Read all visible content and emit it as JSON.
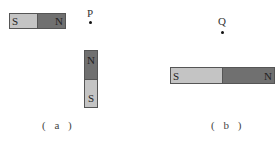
{
  "colors": {
    "south": "#c4c4c4",
    "north": "#707070",
    "outline": "#555555"
  },
  "panel_a": {
    "caption": "( a )",
    "point_label": "P",
    "magnet_horizontal": {
      "left_pole": "S",
      "right_pole": "N"
    },
    "magnet_vertical": {
      "top_pole": "N",
      "bottom_pole": "S"
    }
  },
  "panel_b": {
    "caption": "( b )",
    "point_label": "Q",
    "magnet_horizontal": {
      "left_pole": "S",
      "right_pole": "N"
    }
  }
}
